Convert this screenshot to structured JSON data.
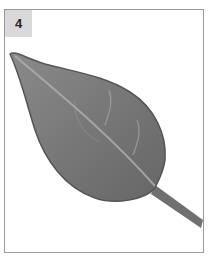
{
  "card": {
    "number_label": "4",
    "illustration": "leaf-illustration",
    "colors": {
      "label_bg": "#d9d9d9",
      "border": "#9a9a9a",
      "leaf_fill": "#7a7a7a",
      "leaf_edge": "#555555",
      "vein": "#b5b5b5"
    }
  }
}
